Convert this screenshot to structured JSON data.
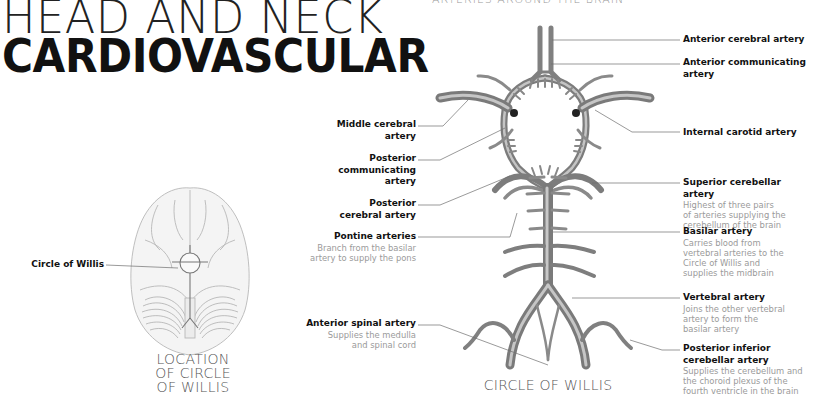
{
  "header": {
    "title_line1": "HEAD AND NECK",
    "title_line2": "CARDIOVASCULAR",
    "section_heading": "ARTERIES AROUND THE BRAIN"
  },
  "location_figure": {
    "label": "Circle of Willis",
    "caption_line1": "LOCATION",
    "caption_line2": "OF CIRCLE",
    "caption_line3": "OF WILLIS"
  },
  "circle_figure": {
    "caption": "CIRCLE OF WILLIS",
    "left_labels": [
      {
        "name": "Middle cerebral",
        "name2": "artery",
        "desc": ""
      },
      {
        "name": "Posterior",
        "name2": "communicating",
        "name3": "artery",
        "desc": ""
      },
      {
        "name": "Posterior",
        "name2": "cerebral artery",
        "desc": ""
      },
      {
        "name": "Pontine arteries",
        "desc1": "Branch from the basilar",
        "desc2": "artery to supply the pons"
      },
      {
        "name": "Anterior spinal artery",
        "desc1": "Supplies the medulla",
        "desc2": "and spinal cord"
      }
    ],
    "right_labels": [
      {
        "name": "Anterior cerebral artery"
      },
      {
        "name": "Anterior communicating",
        "name2": "artery"
      },
      {
        "name": "Internal carotid artery"
      },
      {
        "name": "Superior cerebellar",
        "name2": "artery",
        "desc1": "Highest of three pairs",
        "desc2": "of arteries supplying the",
        "desc3": "cerebellum of the brain"
      },
      {
        "name": "Basilar artery",
        "desc1": "Carries blood from",
        "desc2": "vertebral arteries to the",
        "desc3": "Circle of Willis and",
        "desc4": "supplies the midbrain"
      },
      {
        "name": "Vertebral artery",
        "desc1": "Joins the other vertebral",
        "desc2": "artery to form the",
        "desc3": "basilar artery"
      },
      {
        "name": "Posterior inferior",
        "name2": "cerebellar artery",
        "desc1": "Supplies the cerebellum and",
        "desc2": "the choroid plexus of the",
        "desc3": "fourth ventricle in the brain"
      }
    ]
  },
  "colors": {
    "artery_fill": "#8a8a8a",
    "artery_highlight": "#bdbdbd",
    "leader_line": "#6e6e6e",
    "desc_text": "#9a9a9a",
    "brain_outline": "#b8b8b8"
  }
}
